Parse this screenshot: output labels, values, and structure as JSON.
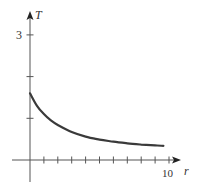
{
  "chart_data": {
    "type": "line",
    "title": "",
    "xlabel": "r",
    "ylabel": "T",
    "xlim": [
      -1.3,
      10.8
    ],
    "ylim": [
      -0.5,
      3.5
    ],
    "x_tick_labels": [
      {
        "value": 10,
        "label": "10"
      }
    ],
    "y_tick_labels": [
      {
        "value": 3,
        "label": "3"
      }
    ],
    "x_ticks": [
      1,
      2,
      3,
      4,
      5,
      6,
      7,
      8,
      9,
      10
    ],
    "y_ticks": [
      1,
      2,
      3
    ],
    "grid": false,
    "legend": null,
    "series": [
      {
        "name": "T(r)",
        "color": "#3a3a3a",
        "x": [
          0,
          0.5,
          1,
          1.5,
          2,
          3,
          4,
          5,
          6,
          7,
          8,
          9,
          9.6
        ],
        "y": [
          1.6,
          1.3,
          1.1,
          0.95,
          0.84,
          0.67,
          0.56,
          0.49,
          0.44,
          0.4,
          0.37,
          0.35,
          0.34
        ]
      }
    ]
  },
  "labels": {
    "y_axis": "T",
    "x_axis": "r",
    "y_tick_3": "3",
    "x_tick_10": "10"
  },
  "colors": {
    "axis": "#555555",
    "curve": "#3a3a3a",
    "text": "#333333"
  }
}
